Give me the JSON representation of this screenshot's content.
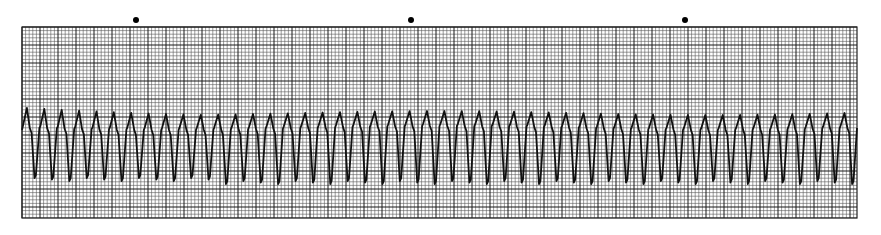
{
  "chart_data": {
    "type": "line",
    "title": "",
    "xlabel": "",
    "ylabel": "",
    "grid": {
      "small_square_px": 3.6,
      "major_every": 5,
      "on": true
    },
    "time_markers": {
      "count": 3,
      "x_px": [
        136,
        411,
        685
      ]
    },
    "beats": 48,
    "rhythm": "regular",
    "complex_shape": "peak then notch on downslope, deep sharp trough",
    "legend": []
  },
  "colors": {
    "grid_minor": "#5a5a5a",
    "grid_major": "#1a1a1a",
    "trace": "#111111",
    "paper": "#ffffff"
  }
}
